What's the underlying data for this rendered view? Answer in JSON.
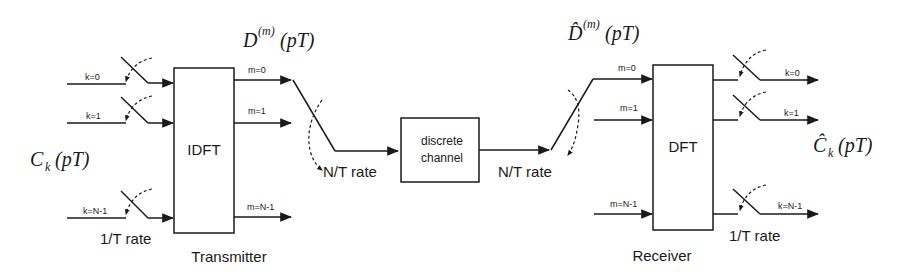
{
  "diagram": {
    "transmitter": {
      "block_label": "IDFT",
      "caption": "Transmitter",
      "input_symbol": {
        "base": "C",
        "sub": "k",
        "arg": "(pT)"
      },
      "inputs": [
        "k=0",
        "k=1",
        "k=N-1"
      ],
      "outputs": [
        "m=0",
        "m=1",
        "m=N-1"
      ],
      "input_rate": "1/T rate",
      "output_symbol": {
        "base": "D",
        "sup": "(m)",
        "arg": "(pT)"
      },
      "commutator_rate": "N/T rate"
    },
    "channel": {
      "line1": "discrete",
      "line2": "channel"
    },
    "receiver": {
      "block_label": "DFT",
      "caption": "Receiver",
      "input_symbol": {
        "base": "D̂",
        "sup": "(m)",
        "arg": "(pT)"
      },
      "commutator_rate": "N/T rate",
      "inputs": [
        "m=0",
        "m=1",
        "m=N-1"
      ],
      "outputs": [
        "k=0",
        "k=1",
        "k=N-1"
      ],
      "output_rate": "1/T rate",
      "output_symbol": {
        "base": "Ĉ",
        "sub": "k",
        "arg": "(pT)"
      }
    }
  }
}
